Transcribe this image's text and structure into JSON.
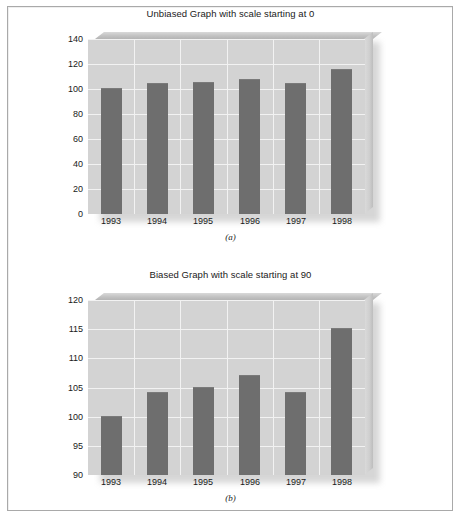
{
  "chart_data": [
    {
      "id": "a",
      "type": "bar",
      "title": "Unbiased Graph with scale starting at 0",
      "caption": "(a)",
      "categories": [
        "1993",
        "1994",
        "1995",
        "1996",
        "1997",
        "1998"
      ],
      "values": [
        100,
        104,
        105,
        107,
        104,
        115
      ],
      "xlabel": "",
      "ylabel": "",
      "ylim": [
        0,
        140
      ],
      "yticks": [
        0,
        20,
        40,
        60,
        80,
        100,
        120,
        140
      ],
      "ytick_labels": [
        "0",
        "20",
        "40",
        "60",
        "80",
        "100",
        "120",
        "140"
      ],
      "grid": true,
      "legend": "none",
      "bar_color": "#6e6e6e",
      "plot_bg": "#d3d3d3",
      "gridline_color": "#f2f2f2"
    },
    {
      "id": "b",
      "type": "bar",
      "title": "Biased Graph with scale starting at 90",
      "caption": "(b)",
      "categories": [
        "1993",
        "1994",
        "1995",
        "1996",
        "1997",
        "1998"
      ],
      "values": [
        100,
        104,
        105,
        107,
        104,
        115
      ],
      "xlabel": "",
      "ylabel": "",
      "ylim": [
        90,
        120
      ],
      "yticks": [
        90,
        95,
        100,
        105,
        110,
        115,
        120
      ],
      "ytick_labels": [
        "90",
        "95",
        "100",
        "105",
        "110",
        "115",
        "120"
      ],
      "grid": true,
      "legend": "none",
      "bar_color": "#6e6e6e",
      "plot_bg": "#d3d3d3",
      "gridline_color": "#f2f2f2"
    }
  ]
}
